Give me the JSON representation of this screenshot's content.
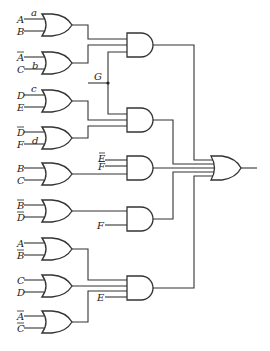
{
  "diagram": {
    "type": "combinational-logic-circuit",
    "or_gates_first_level": [
      {
        "id": "or1",
        "inputs": [
          {
            "label": "A",
            "bar": false
          },
          {
            "label": "B",
            "bar": false
          }
        ],
        "annotation": "a"
      },
      {
        "id": "or2",
        "inputs": [
          {
            "label": "A",
            "bar": true
          },
          {
            "label": "C",
            "bar": false
          }
        ],
        "annotation": "b"
      },
      {
        "id": "or3",
        "inputs": [
          {
            "label": "D",
            "bar": false
          },
          {
            "label": "E",
            "bar": false
          }
        ],
        "annotation": "c"
      },
      {
        "id": "or4",
        "inputs": [
          {
            "label": "D",
            "bar": true
          },
          {
            "label": "F",
            "bar": false
          }
        ],
        "annotation": "d"
      },
      {
        "id": "or5",
        "inputs": [
          {
            "label": "B",
            "bar": false
          },
          {
            "label": "C",
            "bar": false
          }
        ]
      },
      {
        "id": "or6",
        "inputs": [
          {
            "label": "B",
            "bar": true
          },
          {
            "label": "D",
            "bar": true
          }
        ]
      },
      {
        "id": "or7",
        "inputs": [
          {
            "label": "A",
            "bar": false
          },
          {
            "label": "B",
            "bar": true
          }
        ]
      },
      {
        "id": "or8",
        "inputs": [
          {
            "label": "C",
            "bar": false
          },
          {
            "label": "D",
            "bar": false
          }
        ]
      },
      {
        "id": "or9",
        "inputs": [
          {
            "label": "A",
            "bar": true
          },
          {
            "label": "C",
            "bar": true
          }
        ]
      }
    ],
    "and_gates": [
      {
        "id": "and1",
        "inputs": [
          "or1",
          "or2",
          "G"
        ]
      },
      {
        "id": "and2",
        "inputs": [
          "G",
          "or3",
          "or4"
        ]
      },
      {
        "id": "and3",
        "inputs": [
          "E-bar",
          "F-bar",
          "or5"
        ]
      },
      {
        "id": "and4",
        "inputs": [
          "or6",
          "F"
        ]
      },
      {
        "id": "and5",
        "inputs": [
          "or7",
          "or8",
          "or9",
          "E"
        ]
      }
    ],
    "output_gate": {
      "id": "or-final",
      "type": "OR",
      "inputs": [
        "and1",
        "and2",
        "and3",
        "and4",
        "and5"
      ]
    },
    "labels": {
      "a": "a",
      "b": "b",
      "c": "c",
      "d": "d",
      "G": "G",
      "A": "A",
      "B": "B",
      "C": "C",
      "D": "D",
      "E": "E",
      "F": "F"
    }
  }
}
